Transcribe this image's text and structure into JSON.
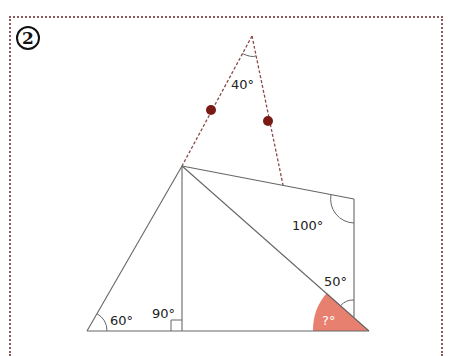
{
  "problem": {
    "number_label": "2"
  },
  "colors": {
    "frame": "#8a5a5a",
    "lines": "#666666",
    "dashed": "#8a4a4a",
    "dots": "#7a1a14",
    "highlight": "#e88070",
    "unknown_text": "#ffffff"
  },
  "angles": {
    "apex": "40°",
    "quad_corner": "100°",
    "right_lower": "50°",
    "bottom_left": "60°",
    "right_angle": "90°",
    "unknown": "?°"
  }
}
